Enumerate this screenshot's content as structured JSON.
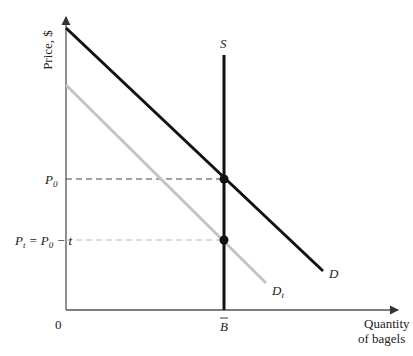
{
  "figure": {
    "y_axis_label": "Price, $",
    "x_axis_label_line1": "Quantity",
    "x_axis_label_line2": "of bagels",
    "origin_label": "0",
    "supply_label": "S",
    "demand_label": "D",
    "taxed_demand_label": "D",
    "taxed_demand_subscript": "t",
    "p0_label": "P",
    "p0_subscript": "0",
    "pt_label_prefix": "P",
    "pt_subscript": "t",
    "pt_equation": " = P",
    "pt_eq_subscript": "0",
    "pt_eq_tail": " − t",
    "quantity_label": "B",
    "colors": {
      "demand": "#111111",
      "taxed_demand": "#c4c4c4",
      "supply": "#111111",
      "axis": "#555555",
      "dash_p0": "#444444",
      "dash_pt": "#bbbbbb"
    }
  }
}
